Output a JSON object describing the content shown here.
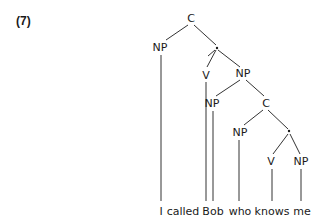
{
  "example_number": "(7)",
  "tree": {
    "nodes": [
      {
        "id": "c1",
        "label": "C",
        "x": 191,
        "y": 22
      },
      {
        "id": "np1",
        "label": "NP",
        "x": 160,
        "y": 51
      },
      {
        "id": "b1",
        "label": "·",
        "x": 217,
        "y": 48
      },
      {
        "id": "v1",
        "label": "V",
        "x": 206,
        "y": 78
      },
      {
        "id": "np2",
        "label": "NP",
        "x": 243,
        "y": 77
      },
      {
        "id": "np3",
        "label": "NP",
        "x": 212,
        "y": 107
      },
      {
        "id": "c2",
        "label": "C",
        "x": 266,
        "y": 107
      },
      {
        "id": "np4",
        "label": "NP",
        "x": 240,
        "y": 136
      },
      {
        "id": "b2",
        "label": "·",
        "x": 289,
        "y": 132
      },
      {
        "id": "v2",
        "label": "V",
        "x": 271,
        "y": 165
      },
      {
        "id": "np5",
        "label": "NP",
        "x": 301,
        "y": 165
      }
    ],
    "words": [
      "I",
      "called",
      "Bob",
      "who",
      "knows",
      "me"
    ]
  }
}
